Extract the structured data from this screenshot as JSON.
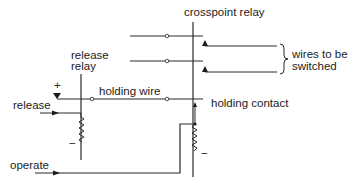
{
  "diagram": {
    "labels": {
      "crosspoint_relay": "crosspoint relay",
      "release_relay_line1": "release",
      "release_relay_line2": "relay",
      "holding_wire": "holding wire",
      "release": "release",
      "operate": "operate",
      "holding_contact": "holding contact",
      "wires_to_be_switched_line1": "wires to be",
      "wires_to_be_switched_line2": "switched",
      "plus_sign": "+",
      "minus_sign_release": "−",
      "minus_sign_crosspoint": "−"
    },
    "colors": {
      "line": "#2a2a2a",
      "text": "#222222",
      "background": "#ffffff"
    }
  }
}
